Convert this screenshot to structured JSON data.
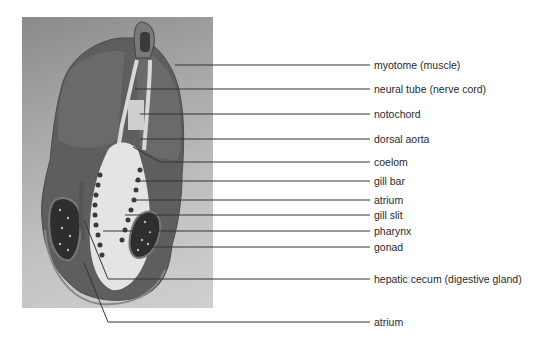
{
  "figure": {
    "type": "labeled micrograph"
  },
  "labels": [
    {
      "id": "myotome",
      "text": "myotome (muscle)",
      "y": 65
    },
    {
      "id": "neural-tube",
      "text": "neural tube (nerve cord)",
      "y": 89
    },
    {
      "id": "notochord",
      "text": "notochord",
      "y": 114
    },
    {
      "id": "dorsal-aorta",
      "text": "dorsal aorta",
      "y": 139
    },
    {
      "id": "coelom",
      "text": "coelom",
      "y": 162
    },
    {
      "id": "gill-bar",
      "text": "gill bar",
      "y": 181
    },
    {
      "id": "atrium-upper",
      "text": "atrium",
      "y": 200
    },
    {
      "id": "gill-slit",
      "text": "gill slit",
      "y": 215
    },
    {
      "id": "pharynx",
      "text": "pharynx",
      "y": 231
    },
    {
      "id": "gonad",
      "text": "gonad",
      "y": 247
    },
    {
      "id": "hepatic-cecum",
      "text": "hepatic cecum (digestive gland)",
      "y": 279
    },
    {
      "id": "atrium-lower",
      "text": "atrium",
      "y": 322
    }
  ]
}
